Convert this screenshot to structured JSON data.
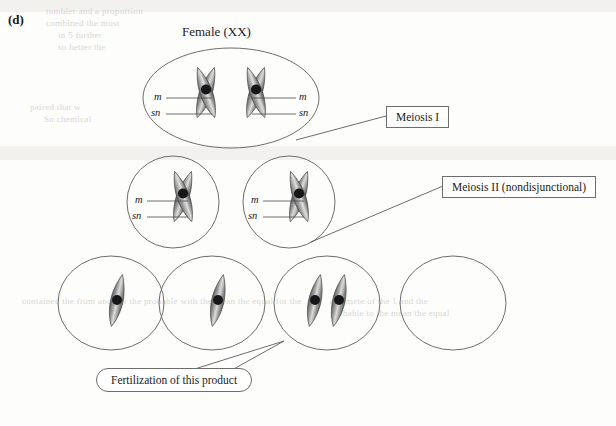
{
  "figure": {
    "panel_letter": "(d)",
    "title": "Female (XX)",
    "background_color": "#fdfdfc",
    "ink_color": "#1a1a1a",
    "cell_outline_color": "#6d6d6d",
    "chromosome_fill_dark": "#6b6b6b",
    "chromosome_fill_light": "#d6d4d2",
    "centromere_color": "#17171a"
  },
  "callouts": [
    {
      "id": "meiosis-1",
      "label": "Meiosis I",
      "shape": "rect"
    },
    {
      "id": "meiosis-2",
      "label": "Meiosis II (nondisjunctional)",
      "shape": "rect"
    },
    {
      "id": "fertilization",
      "label": "Fertilization of this product",
      "shape": "pill"
    }
  ],
  "allele_labels": {
    "m": "m",
    "sn": "sn"
  },
  "stages": [
    {
      "id": "parent-cell",
      "name": "Female (XX) parent cell",
      "chromosome_count": 2,
      "chromosome_type": "x-shaped-dyad",
      "labels_left": [
        "m",
        "sn"
      ],
      "labels_right": [
        "m",
        "sn"
      ]
    },
    {
      "id": "meiosis-i-products",
      "name": "Meiosis I products",
      "cells": [
        {
          "chromosome_count": 1,
          "chromosome_type": "x-shaped-dyad",
          "labels_left": [
            "m",
            "sn"
          ]
        },
        {
          "chromosome_count": 1,
          "chromosome_type": "x-shaped-dyad",
          "labels_left": [
            "m",
            "sn"
          ]
        }
      ]
    },
    {
      "id": "meiosis-ii-products",
      "name": "Meiosis II products (gametes)",
      "cells": [
        {
          "chromosome_count": 1,
          "chromosome_type": "single-chromatid"
        },
        {
          "chromosome_count": 1,
          "chromosome_type": "single-chromatid"
        },
        {
          "chromosome_count": 2,
          "chromosome_type": "single-chromatid",
          "note": "nondisjunction product"
        },
        {
          "chromosome_count": 0,
          "chromosome_type": "none",
          "note": "nullo product"
        }
      ]
    }
  ],
  "ghost_text": {
    "lines": [
      "tumbler and a proportion",
      "combined the most",
      "in 5 further",
      "so better the",
      "paired that w",
      "Sn chemical",
      "contained the from another the probable with the mean the equal for the",
      "a gamete of the 1 and the",
      "probable to the mean the equal"
    ]
  }
}
